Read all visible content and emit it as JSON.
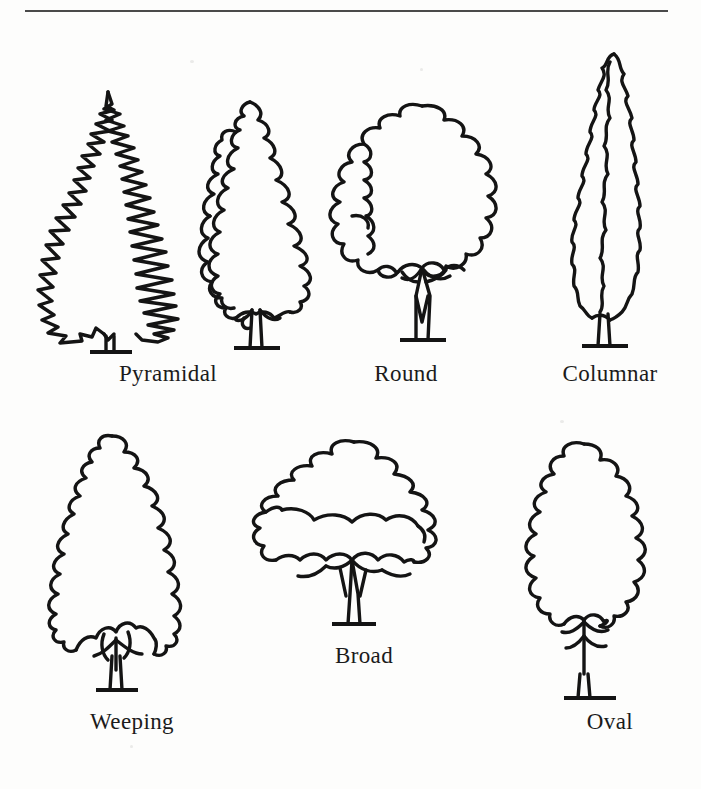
{
  "figure": {
    "kind": "tree-shape-diagram",
    "top_rule": true,
    "background_color": "#fdfdfc",
    "ink_color": "#141414"
  },
  "rows": [
    {
      "name": "top-row",
      "items": [
        {
          "id": "pyramidal",
          "label": "Pyramidal",
          "shape": "pyramidal",
          "tree_count": 2,
          "description": "conifer and broadleaf cone-shaped trees"
        },
        {
          "id": "round",
          "label": "Round",
          "shape": "round",
          "tree_count": 1,
          "description": "wide rounded crown on short trunk"
        },
        {
          "id": "columnar",
          "label": "Columnar",
          "shape": "columnar",
          "tree_count": 1,
          "description": "tall narrow upright crown"
        }
      ]
    },
    {
      "name": "bottom-row",
      "items": [
        {
          "id": "weeping",
          "label": "Weeping",
          "shape": "weeping",
          "tree_count": 1,
          "description": "drooping canopy skirting over branches"
        },
        {
          "id": "broad",
          "label": "Broad",
          "shape": "broad",
          "tree_count": 1,
          "description": "low wide spreading layered canopy"
        },
        {
          "id": "oval",
          "label": "Oval",
          "shape": "oval",
          "tree_count": 1,
          "description": "egg-shaped crown on slender trunk"
        }
      ]
    }
  ],
  "labels": {
    "pyramidal": "Pyramidal",
    "round": "Round",
    "columnar": "Columnar",
    "weeping": "Weeping",
    "broad": "Broad",
    "oval": "Oval"
  }
}
